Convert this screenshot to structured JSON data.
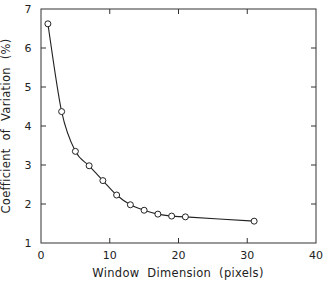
{
  "chart_data": {
    "type": "line",
    "title": "",
    "xlabel": "Window  Dimension  (pixels)",
    "ylabel": "Coefficient  of  Variation  (%)",
    "xlim": [
      0,
      40
    ],
    "ylim": [
      1,
      7
    ],
    "xticks": [
      0,
      10,
      20,
      30,
      40
    ],
    "yticks": [
      1,
      2,
      3,
      4,
      5,
      6,
      7
    ],
    "grid": false,
    "legend": null,
    "markers": "open-circle",
    "line": "smooth-fit",
    "series": [
      {
        "name": "Coefficient of Variation",
        "x": [
          1,
          3,
          5,
          7,
          9,
          11,
          13,
          15,
          17,
          19,
          21,
          31
        ],
        "y": [
          6.62,
          4.37,
          3.35,
          2.98,
          2.6,
          2.23,
          1.98,
          1.84,
          1.74,
          1.69,
          1.67,
          1.56
        ]
      }
    ]
  },
  "frame": {
    "left": 41,
    "right": 316,
    "top": 9,
    "bottom": 243
  },
  "colors": {
    "line": "#222222",
    "axis": "#333333",
    "marker_fill": "#ffffff"
  }
}
